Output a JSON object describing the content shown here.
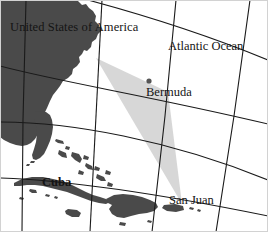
{
  "figure": {
    "kind": "map",
    "width": 268,
    "height": 232,
    "background_color": "#ffffff",
    "frame_color": "#d2d2d2"
  },
  "palette": {
    "land": "#4a4a4a",
    "ocean": "#ffffff",
    "graticule": "#1a1a1a",
    "triangle_fill": "#d4d4d4",
    "label_text": "#141414",
    "marker": "#555555"
  },
  "labels": {
    "usa": "United States of America",
    "atlantic": "Atlantic Ocean",
    "bermuda": "Bermuda",
    "cuba": "Cuba",
    "san_juan": "San Juan"
  },
  "markers": [
    {
      "name": "bermuda-marker",
      "label": "Bermuda",
      "x": 149,
      "y": 81
    }
  ],
  "overlay": {
    "name": "bermuda-triangle",
    "fill": "#d4d4d4",
    "vertices": [
      {
        "name": "miami-vertex",
        "x": 96,
        "y": 58
      },
      {
        "name": "bermuda-vertex",
        "x": 168,
        "y": 92
      },
      {
        "name": "san-juan-vertex",
        "x": 182,
        "y": 204
      }
    ]
  },
  "graticule": {
    "meridians": 5,
    "parallels": 4,
    "style": "curved-projection",
    "color": "#1a1a1a"
  },
  "landmasses": [
    "United States East Coast",
    "Florida Peninsula",
    "Cuba",
    "Bahamas",
    "Hispaniola",
    "Puerto Rico",
    "Jamaica"
  ]
}
